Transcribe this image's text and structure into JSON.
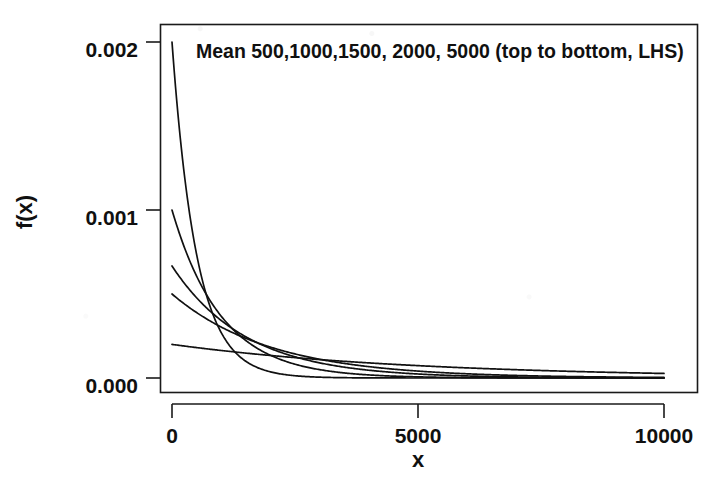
{
  "chart_data": {
    "type": "line",
    "title": "",
    "subtitle": "",
    "xlabel": "x",
    "ylabel": "f(x)",
    "xlim": [
      0,
      10000
    ],
    "ylim": [
      0,
      0.0021
    ],
    "grid": false,
    "legend_position": "none",
    "annotation": "Mean 500,1000,1500, 2000, 5000 (top to bottom, LHS)",
    "x_ticks": [
      0,
      5000,
      10000
    ],
    "x_tick_labels": [
      "0",
      "5000",
      "10000"
    ],
    "y_ticks": [
      0.0,
      0.001,
      0.002
    ],
    "y_tick_labels": [
      "0.000",
      "0.001",
      "0.002"
    ],
    "x": [
      0,
      250,
      500,
      750,
      1000,
      1500,
      2000,
      2500,
      3000,
      3500,
      4000,
      4500,
      5000,
      6000,
      7000,
      8000,
      9000,
      10000
    ],
    "series": [
      {
        "name": "Mean 500",
        "mean": 500,
        "color": "#111111",
        "values": [
          0.002,
          0.001213,
          0.000736,
          0.000446,
          0.000271,
          9.96e-05,
          3.66e-05,
          1.35e-05,
          4.96e-06,
          1.82e-06,
          6.7e-07,
          2.5e-07,
          9e-08,
          1.21e-08,
          1.6e-09,
          2.2e-10,
          3e-11,
          4e-12
        ]
      },
      {
        "name": "Mean 1000",
        "mean": 1000,
        "color": "#111111",
        "values": [
          0.001,
          0.000779,
          0.000607,
          0.000472,
          0.000368,
          0.000223,
          0.000135,
          8.21e-05,
          4.98e-05,
          3.02e-05,
          1.83e-05,
          1.11e-05,
          6.74e-06,
          2.48e-06,
          9.1e-07,
          3.4e-07,
          1.2e-07,
          4.54e-08
        ]
      },
      {
        "name": "Mean 1500",
        "mean": 1500,
        "color": "#111111",
        "values": [
          0.000667,
          0.000564,
          0.000478,
          0.000404,
          0.000342,
          0.000245,
          0.000176,
          0.000126,
          9.02e-05,
          6.46e-05,
          4.63e-05,
          3.32e-05,
          2.38e-05,
          1.22e-05,
          6.25e-06,
          3.2e-06,
          1.64e-06,
          8.4e-07
        ]
      },
      {
        "name": "Mean 2000",
        "mean": 2000,
        "color": "#111111",
        "values": [
          0.0005,
          0.000441,
          0.00039,
          0.000344,
          0.000303,
          0.000236,
          0.000184,
          0.000143,
          0.000112,
          8.69e-05,
          6.77e-05,
          5.27e-05,
          4.1e-05,
          2.49e-05,
          1.51e-05,
          9.16e-06,
          5.56e-06,
          3.37e-06
        ]
      },
      {
        "name": "Mean 5000",
        "mean": 5000,
        "color": "#111111",
        "values": [
          0.0002,
          0.00019,
          0.000181,
          0.000172,
          0.000164,
          0.000148,
          0.000134,
          0.000121,
          0.00011,
          9.93e-05,
          8.99e-05,
          8.13e-05,
          7.36e-05,
          6.02e-05,
          4.93e-05,
          4.04e-05,
          3.3e-05,
          2.7e-05
        ]
      }
    ]
  },
  "axes": {
    "y_label": "f(x)",
    "x_label": "x",
    "y_tick_labels": [
      "0.002",
      "0.001",
      "0.000"
    ],
    "x_tick_labels": [
      "0",
      "5000",
      "10000"
    ]
  },
  "annotation": {
    "text": "Mean 500,1000,1500, 2000, 5000 (top to bottom, LHS)"
  }
}
